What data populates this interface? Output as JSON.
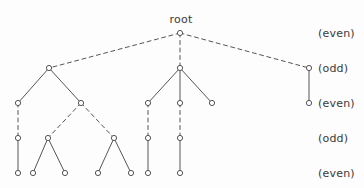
{
  "figure": {
    "root_label": "root",
    "root_label_pos": {
      "x": 181,
      "y": 26
    },
    "level_labels": [
      {
        "text": "(even)",
        "x": 318,
        "y": 33
      },
      {
        "text": "(odd)",
        "x": 318,
        "y": 68
      },
      {
        "text": "(even)",
        "x": 318,
        "y": 103
      },
      {
        "text": "(odd)",
        "x": 318,
        "y": 138
      },
      {
        "text": "(even)",
        "x": 318,
        "y": 173
      }
    ],
    "stroke_color": "#555555",
    "node_fill": "#ffffff",
    "node_radius": 2.6,
    "nodes": [
      {
        "id": "r",
        "x": 180,
        "y": 33,
        "level": 0
      },
      {
        "id": "a",
        "x": 49,
        "y": 68,
        "level": 1
      },
      {
        "id": "b",
        "x": 180,
        "y": 68,
        "level": 1
      },
      {
        "id": "c",
        "x": 309,
        "y": 68,
        "level": 1
      },
      {
        "id": "a1",
        "x": 18,
        "y": 103,
        "level": 2
      },
      {
        "id": "a2",
        "x": 81,
        "y": 103,
        "level": 2
      },
      {
        "id": "b1",
        "x": 148,
        "y": 103,
        "level": 2
      },
      {
        "id": "b2",
        "x": 180,
        "y": 103,
        "level": 2
      },
      {
        "id": "b3",
        "x": 212,
        "y": 103,
        "level": 2
      },
      {
        "id": "c1",
        "x": 309,
        "y": 103,
        "level": 2
      },
      {
        "id": "a1a",
        "x": 18,
        "y": 138,
        "level": 3
      },
      {
        "id": "a2a",
        "x": 48,
        "y": 138,
        "level": 3
      },
      {
        "id": "a2b",
        "x": 114,
        "y": 138,
        "level": 3
      },
      {
        "id": "b1a",
        "x": 148,
        "y": 138,
        "level": 3
      },
      {
        "id": "b2a",
        "x": 180,
        "y": 138,
        "level": 3
      },
      {
        "id": "l1",
        "x": 18,
        "y": 173,
        "level": 4
      },
      {
        "id": "l2",
        "x": 33,
        "y": 173,
        "level": 4
      },
      {
        "id": "l3",
        "x": 65,
        "y": 173,
        "level": 4
      },
      {
        "id": "l4",
        "x": 98,
        "y": 173,
        "level": 4
      },
      {
        "id": "l5",
        "x": 131,
        "y": 173,
        "level": 4
      },
      {
        "id": "l6",
        "x": 148,
        "y": 173,
        "level": 4
      },
      {
        "id": "l7",
        "x": 180,
        "y": 173,
        "level": 4
      }
    ],
    "edges": [
      {
        "from": "r",
        "to": "a",
        "style": "dashed"
      },
      {
        "from": "r",
        "to": "b",
        "style": "dashed"
      },
      {
        "from": "r",
        "to": "c",
        "style": "dashed"
      },
      {
        "from": "a",
        "to": "a1",
        "style": "solid"
      },
      {
        "from": "a",
        "to": "a2",
        "style": "solid"
      },
      {
        "from": "b",
        "to": "b1",
        "style": "solid"
      },
      {
        "from": "b",
        "to": "b2",
        "style": "solid"
      },
      {
        "from": "b",
        "to": "b3",
        "style": "solid"
      },
      {
        "from": "c",
        "to": "c1",
        "style": "solid"
      },
      {
        "from": "a1",
        "to": "a1a",
        "style": "dashed"
      },
      {
        "from": "a2",
        "to": "a2a",
        "style": "dashed"
      },
      {
        "from": "a2",
        "to": "a2b",
        "style": "dashed"
      },
      {
        "from": "b1",
        "to": "b1a",
        "style": "dashed"
      },
      {
        "from": "b2",
        "to": "b2a",
        "style": "dashed"
      },
      {
        "from": "a1a",
        "to": "l1",
        "style": "solid"
      },
      {
        "from": "a2a",
        "to": "l2",
        "style": "solid"
      },
      {
        "from": "a2a",
        "to": "l3",
        "style": "solid"
      },
      {
        "from": "a2b",
        "to": "l4",
        "style": "solid"
      },
      {
        "from": "a2b",
        "to": "l5",
        "style": "solid"
      },
      {
        "from": "b1a",
        "to": "l6",
        "style": "solid"
      },
      {
        "from": "b2a",
        "to": "l7",
        "style": "solid"
      }
    ]
  }
}
